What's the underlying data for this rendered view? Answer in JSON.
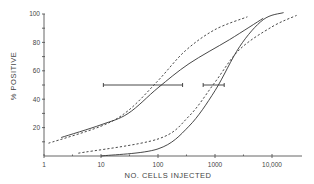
{
  "chart_data": {
    "type": "line",
    "title": "",
    "xlabel": "NO. CELLS INJECTED",
    "ylabel": "% POSITIVE",
    "xscale": "log",
    "xlim": [
      1,
      30000
    ],
    "ylim": [
      0,
      100
    ],
    "x_ticks": [
      "1",
      "10",
      "100",
      "1000",
      "10,000"
    ],
    "y_ticks": [
      "20",
      "40",
      "60",
      "80",
      "100"
    ],
    "grid": false,
    "legend": null,
    "series": [
      {
        "name": "curve A (solid)",
        "style": "solid",
        "x": [
          2,
          10,
          30,
          100,
          350,
          1800,
          7000
        ],
        "y": [
          13,
          22,
          30,
          48,
          65,
          82,
          97
        ]
      },
      {
        "name": "curve A (dashed)",
        "style": "dashed",
        "x": [
          1.2,
          10,
          30,
          100,
          300,
          1000,
          3700
        ],
        "y": [
          9,
          21,
          32,
          53,
          74,
          89,
          98
        ]
      },
      {
        "name": "curve B (solid)",
        "style": "solid",
        "x": [
          10,
          100,
          350,
          1000,
          2700,
          7000,
          16000
        ],
        "y": [
          0,
          5,
          21,
          46,
          77,
          96,
          101
        ]
      },
      {
        "name": "curve B (dashed)",
        "style": "dashed",
        "x": [
          4,
          100,
          350,
          1000,
          2700,
          10000,
          27000
        ],
        "y": [
          2,
          12,
          28,
          52,
          75,
          91,
          99
        ]
      }
    ],
    "error_bars": [
      {
        "y": 50,
        "x_from": 11,
        "x_to": 270,
        "center": 100
      },
      {
        "y": 50,
        "x_from": 620,
        "x_to": 1450,
        "center": 1000
      }
    ]
  }
}
